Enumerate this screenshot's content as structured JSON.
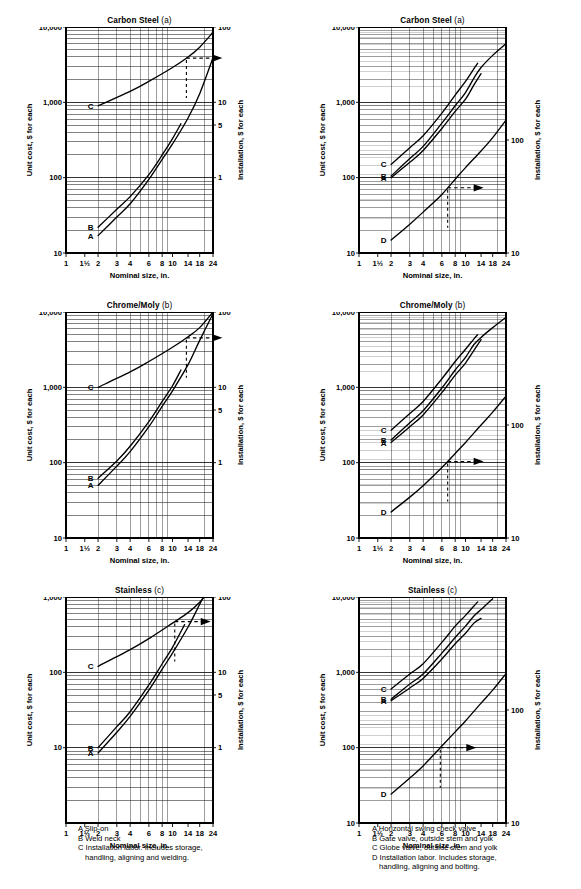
{
  "figure": {
    "axis_labels": {
      "x": "Nominal size, in.",
      "y_left": "Unit cost, $ for each",
      "y_right": "Installation, $ for each"
    },
    "x_ticks": [
      "1",
      "1½",
      "2",
      "3",
      "4",
      "6",
      "8",
      "10",
      "14",
      "18",
      "24"
    ]
  },
  "charts": [
    {
      "id": "flanges-carbon-steel",
      "title_main": "Carbon Steel",
      "title_sub": "(a)",
      "y_left_ticks": [
        "10,000",
        "1,000",
        "100",
        "10"
      ],
      "y_right_ticks": [
        "100",
        "10",
        "5",
        "1"
      ],
      "curve_labels": [
        "C",
        "B",
        "A"
      ]
    },
    {
      "id": "valves-carbon-steel",
      "title_main": "Carbon Steel",
      "title_sub": "(a)",
      "y_left_ticks": [
        "10,000",
        "1,000",
        "100",
        "10"
      ],
      "y_right_ticks": [
        "100",
        "10"
      ],
      "curve_labels": [
        "C",
        "B",
        "A",
        "D"
      ]
    },
    {
      "id": "flanges-chrome-moly",
      "title_main": "Chrome/Moly",
      "title_sub": "(b)",
      "y_left_ticks": [
        "10,000",
        "1,000",
        "100",
        "10"
      ],
      "y_right_ticks": [
        "100",
        "10",
        "5",
        "1"
      ],
      "curve_labels": [
        "C",
        "B",
        "A"
      ]
    },
    {
      "id": "valves-chrome-moly",
      "title_main": "Chrome/Moly",
      "title_sub": "(b)",
      "y_left_ticks": [
        "10,000",
        "1,000",
        "100",
        "10"
      ],
      "y_right_ticks": [
        "100",
        "10"
      ],
      "curve_labels": [
        "C",
        "B",
        "A",
        "D"
      ]
    },
    {
      "id": "flanges-stainless",
      "title_main": "Stainless",
      "title_sub": "(c)",
      "y_left_ticks": [
        "1,000",
        "100",
        "10"
      ],
      "y_right_ticks": [
        "100",
        "10",
        "5",
        "1"
      ],
      "curve_labels": [
        "C",
        "B",
        "A"
      ]
    },
    {
      "id": "valves-stainless",
      "title_main": "Stainless",
      "title_sub": "(c)",
      "y_left_ticks": [
        "10,000",
        "1,000",
        "100",
        "10"
      ],
      "y_right_ticks": [
        "100",
        "10"
      ],
      "curve_labels": [
        "C",
        "B",
        "A",
        "D"
      ]
    }
  ],
  "legend_left": {
    "lines": [
      "A Slip-on",
      "B Weld neck",
      "C Installation labor. Includes storage,"
    ],
    "continuation": "handling, aligning and welding."
  },
  "legend_right": {
    "lines": [
      "A Horizontal swing check valve",
      "B Gate valve, outside stem and yolk",
      "C Globe valve, outside stem and yolk",
      "D Installation labor. Includes storage,"
    ],
    "continuation": "handling, aligning and bolting."
  },
  "chart_data": {
    "type": "line",
    "scale": "log-log",
    "xlabel": "Nominal size, in.",
    "ylabel": "Unit cost, $ for each",
    "ylabel_secondary": "Installation, $ for each",
    "x_tick_values": [
      1,
      1.5,
      2,
      3,
      4,
      6,
      8,
      10,
      14,
      18,
      24
    ],
    "x_tick_labels": [
      "1",
      "1½",
      "2",
      "3",
      "4",
      "6",
      "8",
      "10",
      "14",
      "18",
      "24"
    ],
    "xlim": [
      1,
      24
    ],
    "grid": true,
    "legend_position": "curve-end-labels",
    "panels": [
      {
        "panel": "a-left",
        "title": "Carbon Steel (a)",
        "group": "Flanges",
        "ylim_left": [
          10,
          10000
        ],
        "ylim_right": [
          0.1,
          100
        ],
        "y_left_labeled": [
          10,
          100,
          1000,
          10000
        ],
        "y_right_labeled": [
          1,
          5,
          10,
          100
        ],
        "series": [
          {
            "name": "A",
            "label": "Slip-on",
            "axis": "left",
            "x": [
              2,
              3,
              4,
              6,
              8,
              10,
              14,
              18,
              24
            ],
            "y": [
              17,
              30,
              45,
              95,
              175,
              280,
              620,
              1300,
              3900
            ]
          },
          {
            "name": "B",
            "label": "Weld neck",
            "axis": "left",
            "x": [
              2,
              3,
              4,
              6,
              8,
              10,
              12
            ],
            "y": [
              22,
              38,
              56,
              110,
              200,
              330,
              520
            ]
          },
          {
            "name": "C",
            "label": "Installation labor",
            "axis": "right",
            "x": [
              2,
              4,
              6,
              10,
              14,
              18,
              24
            ],
            "y": [
              9,
              14,
              19,
              29,
              40,
              54,
              85
            ]
          }
        ],
        "annotation": {
          "type": "arrow-to-right-axis",
          "x": 13.5,
          "note": "C reads on right axis"
        }
      },
      {
        "panel": "a-right",
        "title": "Carbon Steel (a)",
        "group": "Valves",
        "ylim_left": [
          10,
          10000
        ],
        "ylim_right": [
          10,
          1000
        ],
        "y_left_labeled": [
          10,
          100,
          1000,
          10000
        ],
        "y_right_labeled": [
          10,
          100
        ],
        "series": [
          {
            "name": "A",
            "label": "Horizontal swing check valve",
            "axis": "left",
            "x": [
              2,
              3,
              4,
              6,
              8,
              10,
              12,
              14
            ],
            "y": [
              100,
              160,
              230,
              450,
              760,
              1100,
              1700,
              2400
            ]
          },
          {
            "name": "B",
            "label": "Gate valve, outside stem and yolk",
            "axis": "left",
            "x": [
              2,
              3,
              4,
              6,
              8,
              10,
              12,
              14,
              18,
              24
            ],
            "y": [
              105,
              180,
              260,
              530,
              900,
              1350,
              2100,
              2900,
              4200,
              6000
            ]
          },
          {
            "name": "C",
            "label": "Globe valve, outside stem and yolk",
            "axis": "left",
            "x": [
              2,
              3,
              4,
              6,
              8,
              10,
              12,
              13
            ],
            "y": [
              150,
              250,
              360,
              720,
              1250,
              1900,
              2800,
              3300
            ]
          },
          {
            "name": "D",
            "label": "Installation labor",
            "axis": "right",
            "x": [
              2,
              3,
              4,
              6,
              8,
              10,
              14,
              18,
              24
            ],
            "y": [
              13,
              18,
              23,
              33,
              45,
              57,
              80,
              105,
              150
            ]
          }
        ],
        "annotation": {
          "type": "arrow-to-right-axis",
          "x": 6.8,
          "note": "D reads on right axis"
        }
      },
      {
        "panel": "b-left",
        "title": "Chrome/Moly (b)",
        "group": "Flanges",
        "ylim_left": [
          10,
          10000
        ],
        "ylim_right": [
          0.1,
          100
        ],
        "y_left_labeled": [
          10,
          100,
          1000,
          10000
        ],
        "y_right_labeled": [
          1,
          5,
          10,
          100
        ],
        "series": [
          {
            "name": "A",
            "label": "Slip-on",
            "axis": "left",
            "x": [
              2,
              3,
              4,
              6,
              8,
              10,
              14,
              18,
              24
            ],
            "y": [
              50,
              90,
              140,
              300,
              560,
              900,
              2000,
              4200,
              9500
            ]
          },
          {
            "name": "B",
            "label": "Weld neck",
            "axis": "left",
            "x": [
              2,
              3,
              4,
              6,
              8,
              10,
              12
            ],
            "y": [
              62,
              105,
              165,
              350,
              650,
              1050,
              1700
            ]
          },
          {
            "name": "C",
            "label": "Installation labor",
            "axis": "right",
            "x": [
              2,
              4,
              6,
              10,
              14,
              18,
              24
            ],
            "y": [
              10,
              16,
              22,
              34,
              47,
              62,
              100
            ]
          }
        ],
        "annotation": {
          "type": "arrow-to-right-axis",
          "x": 13.5,
          "note": "C reads on right axis"
        }
      },
      {
        "panel": "b-right",
        "title": "Chrome/Moly (b)",
        "group": "Valves",
        "ylim_left": [
          10,
          10000
        ],
        "ylim_right": [
          10,
          1000
        ],
        "y_left_labeled": [
          10,
          100,
          1000,
          10000
        ],
        "y_right_labeled": [
          10,
          100
        ],
        "series": [
          {
            "name": "A",
            "label": "Horizontal swing check valve",
            "axis": "left",
            "x": [
              2,
              3,
              4,
              6,
              8,
              10,
              12,
              14
            ],
            "y": [
              185,
              300,
              430,
              850,
              1450,
              2100,
              3100,
              4300
            ]
          },
          {
            "name": "B",
            "label": "Gate valve, outside stem and yolk",
            "axis": "left",
            "x": [
              2,
              3,
              4,
              6,
              8,
              10,
              12,
              14,
              18,
              24
            ],
            "y": [
              200,
              340,
              490,
              980,
              1700,
              2500,
              3700,
              4600,
              6200,
              8500
            ]
          },
          {
            "name": "C",
            "label": "Globe valve, outside stem and yolk",
            "axis": "left",
            "x": [
              2,
              3,
              4,
              6,
              8,
              10,
              12,
              13
            ],
            "y": [
              270,
              450,
              650,
              1300,
              2200,
              3200,
              4400,
              5000
            ]
          },
          {
            "name": "D",
            "label": "Installation labor",
            "axis": "right",
            "x": [
              2,
              3,
              4,
              6,
              8,
              10,
              14,
              18,
              24
            ],
            "y": [
              17,
              23,
              29,
              42,
              56,
              70,
              100,
              130,
              180
            ]
          }
        ],
        "annotation": {
          "type": "arrow-to-right-axis",
          "x": 6.8,
          "note": "D reads on right axis"
        }
      },
      {
        "panel": "c-left",
        "title": "Stainless (c)",
        "group": "Flanges",
        "ylim_left": [
          1,
          1000
        ],
        "ylim_right": [
          0.1,
          100
        ],
        "y_left_labeled": [
          10,
          100,
          1000
        ],
        "y_right_labeled": [
          1,
          5,
          10,
          100
        ],
        "series": [
          {
            "name": "A",
            "label": "Slip-on",
            "axis": "left",
            "x": [
              2,
              3,
              4,
              6,
              8,
              10,
              14,
              18,
              24
            ],
            "y": [
              8.5,
              16,
              26,
              58,
              110,
              180,
              400,
              800,
              1800
            ]
          },
          {
            "name": "B",
            "label": "Weld neck",
            "axis": "left",
            "x": [
              2,
              3,
              4,
              6,
              8,
              10,
              13
            ],
            "y": [
              10,
              19,
              30,
              68,
              130,
              215,
              430
            ]
          },
          {
            "name": "C",
            "label": "Installation labor",
            "axis": "right",
            "x": [
              2,
              4,
              6,
              10,
              14,
              18,
              24
            ],
            "y": [
              12,
              20,
              28,
              45,
              62,
              85,
              140
            ]
          }
        ],
        "annotation": {
          "type": "arrow-to-right-axis",
          "x": 10.5,
          "note": "C reads on right axis"
        }
      },
      {
        "panel": "c-right",
        "title": "Stainless (c)",
        "group": "Valves",
        "ylim_left": [
          10,
          10000
        ],
        "ylim_right": [
          10,
          1000
        ],
        "y_left_labeled": [
          10,
          100,
          1000,
          10000
        ],
        "y_right_labeled": [
          10,
          100
        ],
        "series": [
          {
            "name": "A",
            "label": "Horizontal swing check valve",
            "axis": "left",
            "x": [
              2,
              3,
              4,
              6,
              8,
              10,
              12,
              14
            ],
            "y": [
              420,
              620,
              830,
              1500,
              2400,
              3300,
              4500,
              5200
            ]
          },
          {
            "name": "B",
            "label": "Gate valve, outside stem and yolk",
            "axis": "left",
            "x": [
              2,
              3,
              4,
              6,
              8,
              10,
              12,
              14,
              18
            ],
            "y": [
              440,
              700,
              950,
              1800,
              2900,
              4100,
              5600,
              6800,
              9500
            ]
          },
          {
            "name": "C",
            "label": "Globe valve, outside stem and yolk",
            "axis": "left",
            "x": [
              2,
              3,
              4,
              6,
              8,
              10,
              12,
              13
            ],
            "y": [
              600,
              950,
              1300,
              2500,
              4100,
              5700,
              7600,
              8600
            ]
          },
          {
            "name": "D",
            "label": "Installation labor",
            "axis": "right",
            "x": [
              2,
              3,
              4,
              6,
              8,
              10,
              14,
              18,
              24
            ],
            "y": [
              18,
              25,
              32,
              48,
              64,
              80,
              115,
              150,
              210
            ]
          }
        ],
        "annotation": {
          "type": "arrow-to-right-axis",
          "x": 5.8,
          "note": "D reads on right axis"
        }
      }
    ]
  }
}
